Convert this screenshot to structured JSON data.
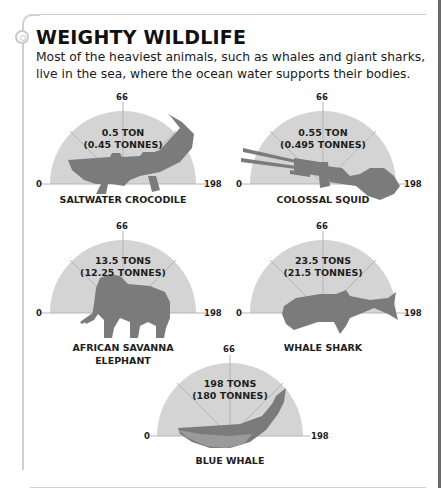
{
  "header": {
    "title": "WEIGHTY WILDLIFE",
    "intro": "Most of the heaviest animals, such as whales and giant sharks, live in the sea, where the ocean water supports their bodies."
  },
  "scale": {
    "min": "0",
    "mid": "66",
    "max": "198"
  },
  "colors": {
    "gauge_fill": "#d4d4d4",
    "tick_line": "#b5b5b5",
    "silhouette": "#7b7b7b",
    "text": "#1e1e1e"
  },
  "animals": [
    {
      "name": "SALTWATER CROCODILE",
      "weight_us": "0.5 TON",
      "weight_metric": "(0.45 TONNES)",
      "silhouette": "crocodile"
    },
    {
      "name": "COLOSSAL SQUID",
      "weight_us": "0.55 TON",
      "weight_metric": "(0.495 TONNES)",
      "silhouette": "squid"
    },
    {
      "name": "AFRICAN SAVANNA",
      "name2": "ELEPHANT",
      "weight_us": "13.5 TONS",
      "weight_metric": "(12.25 TONNES)",
      "silhouette": "elephant"
    },
    {
      "name": "WHALE SHARK",
      "weight_us": "23.5 TONS",
      "weight_metric": "(21.5 TONNES)",
      "silhouette": "whale-shark"
    },
    {
      "name": "BLUE WHALE",
      "weight_us": "198 TONS",
      "weight_metric": "(180 TONNES)",
      "silhouette": "blue-whale"
    }
  ]
}
